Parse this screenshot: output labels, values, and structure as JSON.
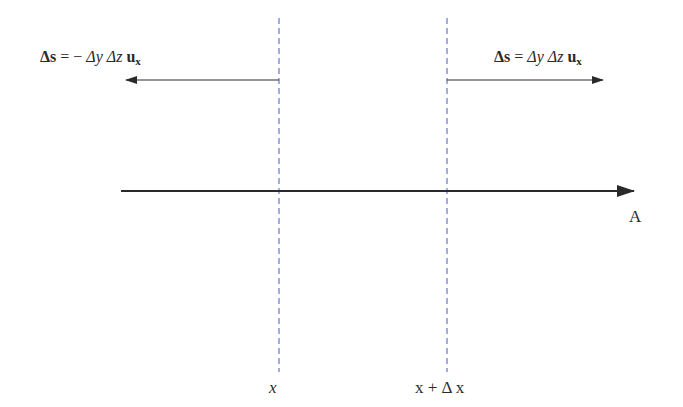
{
  "diagram": {
    "left_surface": {
      "position_label": "x",
      "normal_vector": {
        "lhs": "Δs",
        "equals": "=",
        "sign": "−",
        "term1": "Δy",
        "term2": "Δz",
        "unit": "u",
        "unit_sub": "x"
      },
      "arrow_direction": "left"
    },
    "right_surface": {
      "position_label": "x + Δ x",
      "normal_vector": {
        "lhs": "Δs",
        "equals": "=",
        "term1": "Δy",
        "term2": "Δz",
        "unit": "u",
        "unit_sub": "x"
      },
      "arrow_direction": "right"
    },
    "field_vector": {
      "label": "A",
      "direction": "right"
    },
    "colors": {
      "dashed_line": "#6b74c8",
      "arrow": "#2a2a2a",
      "text": "#2a2a2a"
    }
  }
}
